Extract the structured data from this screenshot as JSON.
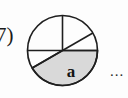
{
  "figure": {
    "item_number_label": "7)",
    "trailing_ellipsis": "...",
    "shaded_sector_label": "a",
    "colors": {
      "stroke": "#1f1f1f",
      "shaded_fill": "#d9d9d9",
      "unshaded_fill": "#ffffff",
      "background": "#fdfdfd",
      "text": "#141414"
    },
    "circle": {
      "center_x": 62.5,
      "center_y": 50.5,
      "radius": 35,
      "stroke_width": 1.6
    },
    "radii_angles_deg": [
      0,
      30,
      90,
      180,
      210
    ],
    "sectors": [
      {
        "name": "upper-left-quadrant",
        "start_deg": 90,
        "end_deg": 180,
        "shaded": false,
        "label": ""
      },
      {
        "name": "upper-right-large",
        "start_deg": 30,
        "end_deg": 90,
        "shaded": false,
        "label": ""
      },
      {
        "name": "upper-right-small",
        "start_deg": 0,
        "end_deg": 30,
        "shaded": false,
        "label": ""
      },
      {
        "name": "lower-left-small",
        "start_deg": 180,
        "end_deg": 210,
        "shaded": false,
        "label": ""
      },
      {
        "name": "lower-shaded",
        "start_deg": 210,
        "end_deg": 360,
        "shaded": true,
        "label": "a"
      }
    ],
    "label_position": {
      "x": 71,
      "y": 77
    }
  }
}
